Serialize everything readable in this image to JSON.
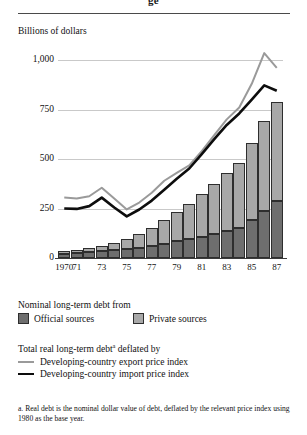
{
  "figure": {
    "title_fragment": "ge",
    "axis_title": "Billions of dollars",
    "footnote_marker": "a",
    "footnote": "a. Real debt is the nominal dollar value of debt, deflated by the relevant price index using 1980 as the base year."
  },
  "legend": {
    "bars_title": "Nominal long-term debt from",
    "official_label": "Official sources",
    "private_label": "Private sources",
    "lines_title_prefix": "Total real long-term debt",
    "lines_title_suffix": " deflated by",
    "export_label": "Developing-country export price index",
    "import_label": "Developing-country import price index"
  },
  "colors": {
    "official": "#6e6e6e",
    "private": "#a8a8a8",
    "export_line": "#9a9a9a",
    "import_line": "#0d0d0d",
    "gridline": "#c9c9c9",
    "axis": "#3a3a3a"
  },
  "chart_data": {
    "type": "bar",
    "title": "",
    "subtitle": "",
    "xlabel": "",
    "ylabel": "Billions of dollars",
    "ylim": [
      0,
      1000
    ],
    "yticks": [
      0,
      250,
      500,
      750,
      1000
    ],
    "ytick_labels": [
      "0",
      "250",
      "500",
      "750",
      "1,000"
    ],
    "grid": true,
    "legend_position": "below",
    "stacked": true,
    "x": [
      1970,
      1971,
      1972,
      1973,
      1974,
      1975,
      1976,
      1977,
      1978,
      1979,
      1980,
      1981,
      1982,
      1983,
      1984,
      1985,
      1986,
      1987
    ],
    "categories": [
      "1970",
      "71",
      "72",
      "73",
      "74",
      "75",
      "76",
      "77",
      "78",
      "79",
      "80",
      "81",
      "82",
      "83",
      "84",
      "85",
      "86",
      "87"
    ],
    "xtick_labels": [
      "1970",
      "71",
      "73",
      "75",
      "77",
      "79",
      "81",
      "83",
      "85",
      "87"
    ],
    "xtick_years": [
      1970,
      1971,
      1973,
      1975,
      1977,
      1979,
      1981,
      1983,
      1985,
      1987
    ],
    "series": [
      {
        "name": "Official sources",
        "type": "bar",
        "color": "#6e6e6e",
        "values": [
          21,
          24,
          28,
          33,
          38,
          45,
          53,
          62,
          73,
          84,
          96,
          108,
          120,
          138,
          152,
          190,
          235,
          290
        ]
      },
      {
        "name": "Private sources",
        "type": "bar",
        "color": "#a8a8a8",
        "values": [
          14,
          17,
          22,
          29,
          38,
          50,
          67,
          88,
          117,
          146,
          179,
          217,
          255,
          292,
          330,
          390,
          455,
          500
        ]
      },
      {
        "name": "Developing-country export price index",
        "type": "line",
        "color": "#9a9a9a",
        "values": [
          305,
          300,
          312,
          355,
          300,
          245,
          280,
          330,
          390,
          430,
          468,
          540,
          620,
          700,
          760,
          880,
          1035,
          960
        ]
      },
      {
        "name": "Developing-country import price index",
        "type": "line",
        "color": "#0d0d0d",
        "values": [
          250,
          248,
          262,
          305,
          255,
          210,
          245,
          290,
          345,
          400,
          452,
          525,
          600,
          672,
          730,
          800,
          872,
          845
        ]
      }
    ]
  }
}
